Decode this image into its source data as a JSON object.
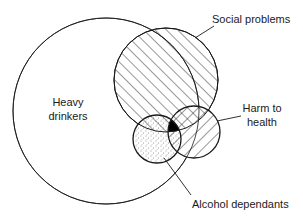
{
  "diagram": {
    "type": "venn",
    "sets": [
      {
        "id": "heavy_drinkers",
        "label_lines": [
          "Heavy",
          "drinkers"
        ],
        "fill": "none",
        "cx": 106,
        "cy": 111,
        "r": 93
      },
      {
        "id": "social_problems",
        "label_lines": [
          "Social problems"
        ],
        "fill": "diagonal-hatch",
        "cx": 166,
        "cy": 80,
        "r": 52
      },
      {
        "id": "harm_to_health",
        "label_lines": [
          "Harm to",
          "health"
        ],
        "fill": "reverse-diagonal-hatch",
        "cx": 194,
        "cy": 132,
        "r": 26
      },
      {
        "id": "alcohol_dependants",
        "label_lines": [
          "Alcohol dependants"
        ],
        "fill": "stipple",
        "cx": 157,
        "cy": 139,
        "r": 24
      }
    ],
    "triple_overlap": {
      "sets": [
        "social_problems",
        "harm_to_health",
        "alcohol_dependants"
      ],
      "fill": "solid-black"
    },
    "labels": {
      "heavy_1": "Heavy",
      "heavy_2": "drinkers",
      "social": "Social problems",
      "harm_1": "Harm to",
      "harm_2": "health",
      "alcohol": "Alcohol dependants"
    },
    "colors": {
      "stroke": "#1a1a1a",
      "background": "#ffffff",
      "overlap_fill": "#000000"
    }
  }
}
